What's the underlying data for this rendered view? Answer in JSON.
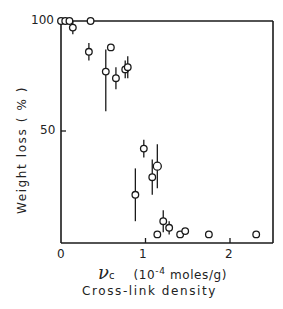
{
  "chart_data": {
    "type": "scatter",
    "title": "",
    "xlabel": "Cross-link density",
    "x_symbol": "ν",
    "x_symbol_sub": "c",
    "x_units_pre": "(10",
    "x_units_exp": "-4",
    "x_units_post": " moles/g)",
    "ylabel": "Weight loss ( % )",
    "xlim": [
      0,
      2.5
    ],
    "ylim": [
      0,
      100
    ],
    "x_ticks": [
      0,
      1,
      2
    ],
    "y_ticks": [
      50,
      100
    ],
    "grid": false,
    "legend": null,
    "error_bars": true,
    "series": [
      {
        "name": "Weight loss vs cross-link density",
        "marker": "open-circle",
        "points": [
          {
            "x": 0.0,
            "y": 100,
            "err_lo": 0,
            "err_hi": 0
          },
          {
            "x": 0.05,
            "y": 100,
            "err_lo": 0,
            "err_hi": 0
          },
          {
            "x": 0.1,
            "y": 100,
            "err_lo": 0,
            "err_hi": 0
          },
          {
            "x": 0.14,
            "y": 97,
            "err_lo": 3,
            "err_hi": 3
          },
          {
            "x": 0.35,
            "y": 100,
            "err_lo": 0,
            "err_hi": 0
          },
          {
            "x": 0.33,
            "y": 86,
            "err_lo": 4,
            "err_hi": 4
          },
          {
            "x": 0.53,
            "y": 77,
            "err_lo": 18,
            "err_hi": 10
          },
          {
            "x": 0.59,
            "y": 88,
            "err_lo": 0,
            "err_hi": 0
          },
          {
            "x": 0.65,
            "y": 74,
            "err_lo": 5,
            "err_hi": 5
          },
          {
            "x": 0.76,
            "y": 78,
            "err_lo": 4,
            "err_hi": 4
          },
          {
            "x": 0.79,
            "y": 79,
            "err_lo": 5,
            "err_hi": 5
          },
          {
            "x": 0.88,
            "y": 21,
            "err_lo": 12,
            "err_hi": 12
          },
          {
            "x": 0.98,
            "y": 42,
            "err_lo": 4,
            "err_hi": 4
          },
          {
            "x": 1.08,
            "y": 29,
            "err_lo": 8,
            "err_hi": 8
          },
          {
            "x": 1.14,
            "y": 34,
            "err_lo": 10,
            "err_hi": 10
          },
          {
            "x": 1.14,
            "y": 3,
            "err_lo": 0,
            "err_hi": 0
          },
          {
            "x": 1.21,
            "y": 9,
            "err_lo": 5,
            "err_hi": 5
          },
          {
            "x": 1.28,
            "y": 6,
            "err_lo": 3,
            "err_hi": 3
          },
          {
            "x": 1.41,
            "y": 3,
            "err_lo": 0,
            "err_hi": 0
          },
          {
            "x": 1.47,
            "y": 4.5,
            "err_lo": 0,
            "err_hi": 0
          },
          {
            "x": 1.75,
            "y": 3,
            "err_lo": 0,
            "err_hi": 0
          },
          {
            "x": 2.31,
            "y": 3,
            "err_lo": 0,
            "err_hi": 0
          }
        ]
      }
    ]
  },
  "axes": {
    "y_tick_labels": [
      "100",
      "50"
    ],
    "x_tick_labels": [
      "0",
      "1",
      "2"
    ]
  }
}
